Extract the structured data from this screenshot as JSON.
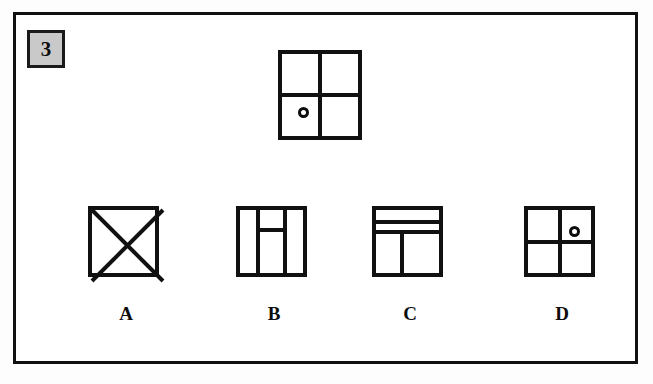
{
  "page": {
    "background_color": "#ffffff",
    "ink_color": "#111111"
  },
  "question": {
    "number": "3",
    "badge_fill_color": "#c9c9c9",
    "badge_border_color": "#1a1a1a"
  },
  "prompt_figure": {
    "name": "prompt-figure",
    "shape": "square",
    "divisions": [
      "vertical-midline",
      "horizontal-midline"
    ],
    "marker": {
      "type": "circle-outline",
      "quadrant": "bottom-left"
    }
  },
  "options": [
    {
      "id": "a",
      "label": "A",
      "shape": "square",
      "divisions": [
        "diagonal-top-left-to-bottom-right",
        "diagonal-top-right-to-bottom-left"
      ],
      "marker": null
    },
    {
      "id": "b",
      "label": "B",
      "shape": "square",
      "divisions": [
        "vertical-left",
        "vertical-right",
        "short-horizontal-upper-middle"
      ],
      "marker": null
    },
    {
      "id": "c",
      "label": "C",
      "shape": "square",
      "divisions": [
        "horizontal-upper",
        "horizontal-second",
        "vertical-lower-left"
      ],
      "marker": null
    },
    {
      "id": "d",
      "label": "D",
      "shape": "square",
      "divisions": [
        "vertical-midline",
        "horizontal-midline"
      ],
      "marker": {
        "type": "circle-outline",
        "quadrant": "top-right"
      }
    }
  ]
}
